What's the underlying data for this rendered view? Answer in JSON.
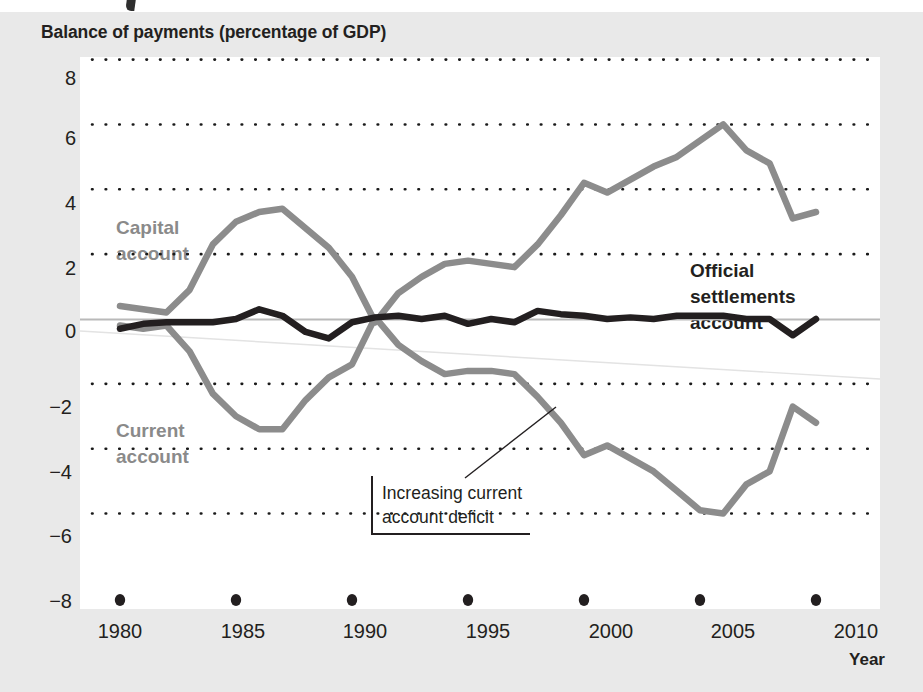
{
  "chart_data": {
    "type": "line",
    "title": "Balance of payments (percentage of GDP)",
    "xlabel": "Year",
    "ylabel": "",
    "xlim": [
      1979,
      2011
    ],
    "ylim": [
      -8,
      8
    ],
    "grid": true,
    "legend_position": "inline-labels",
    "x_ticks": [
      "1980",
      "1985",
      "1990",
      "1995",
      "2000",
      "2005",
      "2010"
    ],
    "x_tick_values": [
      1980,
      1985,
      1990,
      1995,
      2000,
      2005,
      2010
    ],
    "y_ticks": [
      "8",
      "6",
      "4",
      "2",
      "0",
      "−2",
      "−4",
      "−6",
      "−8"
    ],
    "y_tick_values": [
      8,
      6,
      4,
      2,
      0,
      -2,
      -4,
      -6,
      -8
    ],
    "x": [
      1980,
      1981,
      1982,
      1983,
      1984,
      1985,
      1986,
      1987,
      1988,
      1989,
      1990,
      1991,
      1992,
      1993,
      1994,
      1995,
      1996,
      1997,
      1998,
      1999,
      2000,
      2001,
      2002,
      2003,
      2004,
      2005,
      2006,
      2007,
      2008,
      2009,
      2010
    ],
    "series": [
      {
        "name": "Capital account",
        "color": "#8c8c8c",
        "values": [
          0.4,
          0.3,
          0.2,
          0.9,
          2.3,
          3.0,
          3.3,
          3.4,
          2.8,
          2.2,
          1.3,
          -0.1,
          0.8,
          1.3,
          1.7,
          1.8,
          1.7,
          1.6,
          2.3,
          3.2,
          4.2,
          3.9,
          4.3,
          4.7,
          5.0,
          5.5,
          6.0,
          5.2,
          4.8,
          3.1,
          3.3
        ]
      },
      {
        "name": "Current account",
        "color": "#8c8c8c",
        "values": [
          -0.2,
          -0.3,
          -0.2,
          -1.0,
          -2.3,
          -3.0,
          -3.4,
          -3.4,
          -2.5,
          -1.8,
          -1.4,
          0.05,
          -0.8,
          -1.3,
          -1.7,
          -1.6,
          -1.6,
          -1.7,
          -2.4,
          -3.2,
          -4.2,
          -3.9,
          -4.3,
          -4.7,
          -5.3,
          -5.9,
          -6.0,
          -5.1,
          -4.7,
          -2.7,
          -3.2
        ]
      },
      {
        "name": "Official settlements account",
        "color": "#231f20",
        "values": [
          -0.3,
          -0.15,
          -0.1,
          -0.1,
          -0.1,
          0.0,
          0.3,
          0.1,
          -0.4,
          -0.6,
          -0.1,
          0.05,
          0.1,
          0.0,
          0.1,
          -0.15,
          0.0,
          -0.1,
          0.25,
          0.15,
          0.1,
          0.0,
          0.05,
          0.0,
          0.1,
          0.1,
          0.1,
          0.0,
          0.0,
          -0.5,
          0.0
        ]
      }
    ],
    "annotations": [
      {
        "text": "Increasing current\naccount deficit",
        "points_to_x": 1996.5,
        "points_to_y": -1.7
      }
    ],
    "inline_labels": [
      {
        "text": "Capital\naccount",
        "color_role": "gray"
      },
      {
        "text": "Current\naccount",
        "color_role": "gray"
      },
      {
        "text": "Official\nsettlements\naccount",
        "color_role": "dark"
      }
    ]
  },
  "colors": {
    "figure_background": "#e9e9e9",
    "plot_background": "#ffffff",
    "gray_series": "#8c8c8c",
    "dark_series": "#231f20",
    "gridline": "#1a1a1a",
    "zero_line": "#b5b5b5",
    "text": "#231f20"
  },
  "labels": {
    "capital_account": "Capital\naccount",
    "current_account": "Current\naccount",
    "official_settlements_account": "Official\nsettlements\naccount",
    "annotation": "Increasing current\naccount deficit",
    "year_axis": "Year"
  },
  "y_ticks": [
    {
      "label": "8"
    },
    {
      "label": "6"
    },
    {
      "label": "4"
    },
    {
      "label": "2"
    },
    {
      "label": "0"
    },
    {
      "label": "−2"
    },
    {
      "label": "−4"
    },
    {
      "label": "−6"
    },
    {
      "label": "−8"
    }
  ],
  "x_ticks": [
    {
      "label": "1980"
    },
    {
      "label": "1985"
    },
    {
      "label": "1990"
    },
    {
      "label": "1995"
    },
    {
      "label": "2000"
    },
    {
      "label": "2005"
    },
    {
      "label": "2010"
    }
  ]
}
